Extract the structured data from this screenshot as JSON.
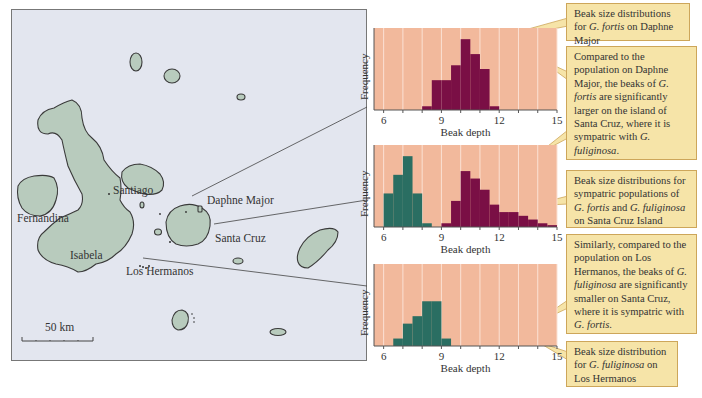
{
  "map": {
    "labels": {
      "santiago": "Santiago",
      "fernandina": "Fernandina",
      "isabela": "Isabela",
      "daphne_major": "Daphne Major",
      "santa_cruz": "Santa Cruz",
      "los_hermanos": "Los Hermanos"
    },
    "scale_bar": "50 km",
    "colors": {
      "water": "#e3e6ef",
      "land": "#b8cbbd",
      "coast": "#3a3a3a"
    }
  },
  "callouts": [
    {
      "id": "c1",
      "parts": [
        "Beak size distributions for ",
        {
          "i": "G. fortis"
        },
        " on Daphne Major"
      ]
    },
    {
      "id": "c2",
      "parts": [
        "Compared to the population on Daphne Major, the beaks of ",
        {
          "i": "G. fortis"
        },
        " are significantly larger on the island of Santa Cruz, where it is sympatric with ",
        {
          "i": "G. fuliginosa"
        },
        "."
      ]
    },
    {
      "id": "c3",
      "parts": [
        "Beak size distributions for sympatric populations of ",
        {
          "i": "G. fortis"
        },
        " and ",
        {
          "i": "G. fuliginosa"
        },
        " on Santa Cruz Island"
      ]
    },
    {
      "id": "c4",
      "parts": [
        "Similarly, compared to the population on Los Hermanos, the beaks of ",
        {
          "i": "G. fuliginosa"
        },
        " are significantly smaller on Santa Cruz, where it is sympatric with ",
        {
          "i": "G. fortis"
        },
        "."
      ]
    },
    {
      "id": "c5",
      "parts": [
        "Beak size distribution for ",
        {
          "i": "G. fuliginosa"
        },
        " on Los Hermanos"
      ]
    }
  ],
  "chart_data": [
    {
      "type": "bar",
      "title": "Beak size distributions for G. fortis on Daphne Major",
      "xlabel": "Beak depth",
      "ylabel": "Frequency",
      "xlim": [
        5.5,
        15
      ],
      "xticks": [
        6,
        9,
        12,
        15
      ],
      "grid": "vertical lines every 1 unit",
      "bin_width": 0.5,
      "series": [
        {
          "name": "G. fortis",
          "color": "#7a0f45",
          "bins": [
            8.0,
            8.5,
            9.0,
            9.5,
            10.0,
            10.5,
            11.0,
            11.5
          ],
          "values": [
            1,
            8,
            8,
            12,
            19,
            15,
            11,
            1
          ]
        }
      ],
      "ylim": [
        0,
        22
      ]
    },
    {
      "type": "bar",
      "title": "Beak size distributions for sympatric populations of G. fortis and G. fuliginosa on Santa Cruz Island",
      "xlabel": "Beak depth",
      "ylabel": "Frequency",
      "xlim": [
        5.5,
        15
      ],
      "xticks": [
        6,
        9,
        12,
        15
      ],
      "grid": "vertical lines every 1 unit",
      "bin_width": 0.5,
      "series": [
        {
          "name": "G. fuliginosa",
          "color": "#2a6e62",
          "bins": [
            6.0,
            6.5,
            7.0,
            7.5,
            8.0
          ],
          "values": [
            9,
            14,
            19,
            9,
            1
          ]
        },
        {
          "name": "G. fortis",
          "color": "#7a0f45",
          "bins": [
            9.0,
            9.5,
            10.0,
            10.5,
            11.0,
            11.5,
            12.0,
            12.5,
            13.0,
            13.5,
            14.0,
            14.5
          ],
          "values": [
            1,
            7,
            15,
            13,
            10,
            6,
            4,
            4,
            3,
            2,
            1,
            0.5
          ]
        }
      ],
      "ylim": [
        0,
        22
      ]
    },
    {
      "type": "bar",
      "title": "Beak size distribution for G. fuliginosa on Los Hermanos",
      "xlabel": "Beak depth",
      "ylabel": "Frequency",
      "xlim": [
        5.5,
        15
      ],
      "xticks": [
        6,
        9,
        12,
        15
      ],
      "grid": "vertical lines every 1 unit",
      "bin_width": 0.5,
      "series": [
        {
          "name": "G. fuliginosa",
          "color": "#2a6e62",
          "bins": [
            6.5,
            7.0,
            7.5,
            8.0,
            8.5,
            9.0
          ],
          "values": [
            2,
            6,
            8,
            12,
            12,
            2
          ]
        }
      ],
      "ylim": [
        0,
        22
      ]
    }
  ]
}
